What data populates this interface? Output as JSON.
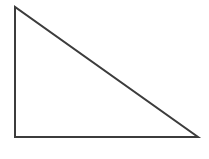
{
  "canvas": {
    "width": 209,
    "height": 159,
    "background_color": "#ffffff",
    "figure_name": "right-triangle"
  },
  "chart_data": {
    "type": "diagram",
    "title": "",
    "subtitle": "",
    "xlabel": "",
    "ylabel": "",
    "grid": false,
    "legend": null,
    "annotations": [],
    "shapes": [
      {
        "name": "right-triangle",
        "kind": "polygon",
        "closed": true,
        "fill": "none",
        "stroke_color": "#3c3c3c",
        "stroke_width": 2,
        "points": [
          {
            "label": "apex",
            "x": 15,
            "y": 7
          },
          {
            "label": "bottom-left",
            "x": 15,
            "y": 137
          },
          {
            "label": "bottom-right",
            "x": 198,
            "y": 137
          }
        ],
        "edges": [
          {
            "label": "vertical-leg",
            "from": "apex",
            "to": "bottom-left",
            "length_px": 130
          },
          {
            "label": "horizontal-leg",
            "from": "bottom-left",
            "to": "bottom-right",
            "length_px": 183
          },
          {
            "label": "hypotenuse",
            "from": "bottom-right",
            "to": "apex",
            "length_px": 224
          }
        ],
        "right_angle_at": "bottom-left"
      }
    ]
  }
}
